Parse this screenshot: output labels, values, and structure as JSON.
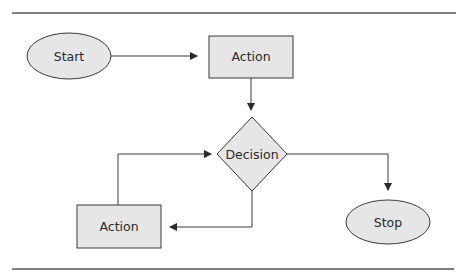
{
  "diagram": {
    "type": "flowchart",
    "colors": {
      "shape_fill": "#e6e6e6",
      "stroke": "#3a3a3a",
      "rule": "#555555",
      "text": "#2a2a2a",
      "background": "#ffffff"
    },
    "nodes": {
      "start": {
        "label": "Start",
        "shape": "ellipse"
      },
      "action_top": {
        "label": "Action",
        "shape": "rectangle"
      },
      "decision": {
        "label": "Decision",
        "shape": "diamond"
      },
      "action_bottom": {
        "label": "Action",
        "shape": "rectangle"
      },
      "stop": {
        "label": "Stop",
        "shape": "ellipse"
      }
    },
    "edges": [
      {
        "from": "start",
        "to": "action_top"
      },
      {
        "from": "action_top",
        "to": "decision"
      },
      {
        "from": "decision",
        "to": "stop"
      },
      {
        "from": "decision",
        "to": "action_bottom"
      },
      {
        "from": "action_bottom",
        "to": "decision"
      }
    ]
  }
}
